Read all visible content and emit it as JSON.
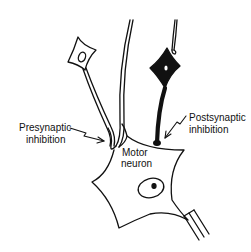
{
  "diagram": {
    "type": "neuron-inhibition-schematic",
    "labels": {
      "presynaptic_line1": "Presynaptic",
      "presynaptic_line2": "inhibition",
      "postsynaptic_line1": "Postsynaptic",
      "postsynaptic_line2": "inhibition",
      "motor_line1": "Motor",
      "motor_line2": "neuron"
    },
    "elements": [
      {
        "id": "excitatory-interneuron",
        "style": "outline",
        "description": "small outlined neuron, upper left"
      },
      {
        "id": "inhibitory-interneuron",
        "style": "filled",
        "description": "black filled neuron, upper right"
      },
      {
        "id": "descending-axon",
        "style": "outline",
        "description": "long axon from top center"
      },
      {
        "id": "motor-neuron",
        "style": "outline",
        "description": "large star-shaped cell body with nucleus"
      },
      {
        "id": "motor-axon",
        "style": "outline",
        "description": "axon exiting lower right"
      }
    ],
    "colors": {
      "ink": "#111111",
      "background": "#ffffff"
    }
  }
}
